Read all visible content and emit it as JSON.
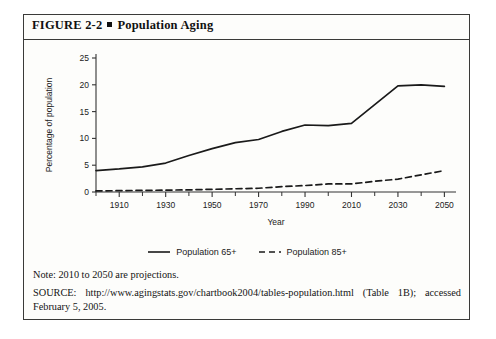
{
  "figure": {
    "number": "FIGURE 2-2",
    "bullet": "square-bullet",
    "title": "Population Aging"
  },
  "notes": {
    "note": "Note: 2010 to 2050 are projections.",
    "source": "SOURCE: http://www.agingstats.gov/chartbook2004/tables-population.html (Table 1B); accessed February 5, 2005."
  },
  "legend": {
    "items": [
      {
        "label": "Population 65+",
        "style": "solid",
        "color": "#1a1a1a"
      },
      {
        "label": "Population 85+",
        "style": "dashed",
        "color": "#1a1a1a"
      }
    ]
  },
  "chart_data": {
    "type": "line",
    "title": "Population Aging",
    "xlabel": "Year",
    "ylabel": "Percentage of population",
    "xlim": [
      1900,
      2055
    ],
    "ylim": [
      0,
      25
    ],
    "yticks": [
      0,
      5,
      10,
      15,
      20,
      25
    ],
    "xticks_major": [
      1910,
      1930,
      1950,
      1970,
      1990,
      2010,
      2030,
      2050
    ],
    "xticks_minor": [
      1900,
      1920,
      1940,
      1960,
      1980,
      2000,
      2020,
      2040
    ],
    "grid": false,
    "legend_position": "bottom-center",
    "x": [
      1900,
      1910,
      1920,
      1930,
      1940,
      1950,
      1960,
      1970,
      1980,
      1990,
      2000,
      2010,
      2020,
      2030,
      2040,
      2050
    ],
    "series": [
      {
        "name": "Population 65+",
        "style": "solid",
        "values": [
          4.0,
          4.3,
          4.7,
          5.4,
          6.8,
          8.1,
          9.2,
          9.8,
          11.3,
          12.5,
          12.4,
          12.8,
          16.3,
          19.8,
          20.0,
          19.7
        ]
      },
      {
        "name": "Population 85+",
        "style": "dashed",
        "values": [
          0.2,
          0.25,
          0.3,
          0.35,
          0.4,
          0.5,
          0.6,
          0.7,
          1.0,
          1.2,
          1.5,
          1.5,
          2.0,
          2.4,
          3.2,
          4.0
        ]
      }
    ],
    "annotations": [
      "2010 to 2050 are projections"
    ]
  }
}
